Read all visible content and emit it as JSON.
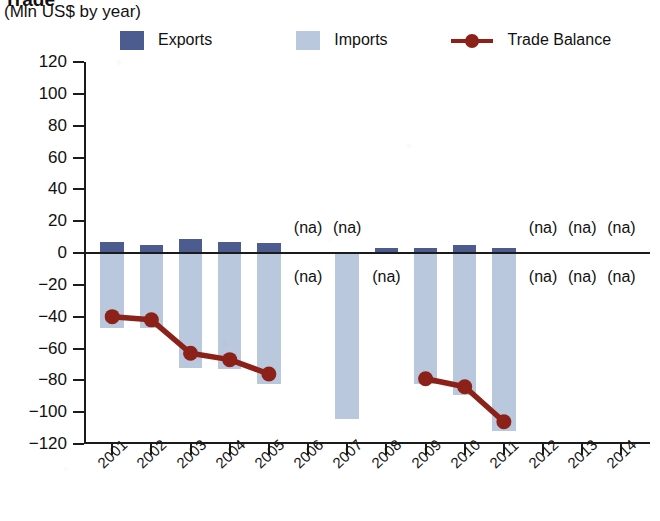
{
  "header": {
    "title": "Trade",
    "subtitle": "(Mln US$ by year)"
  },
  "legend": {
    "items": [
      {
        "label": "Exports",
        "type": "swatch",
        "color": "#4d5c8e"
      },
      {
        "label": "Imports",
        "type": "swatch",
        "color": "#b9c8dc"
      },
      {
        "label": "Trade Balance",
        "type": "line",
        "color": "#8b2118"
      }
    ]
  },
  "colors": {
    "exports": "#4d5c8e",
    "imports": "#b9c8dc",
    "trade_balance": "#8b2118",
    "axis": "#1b1b1b",
    "background": "#ffffff"
  },
  "na_text": "(na)",
  "chart_data": {
    "type": "bar",
    "title": "Trade",
    "subtitle": "(Mln US$ by year)",
    "xlabel": "",
    "ylabel": "Mln US$",
    "ylim": [
      -120,
      120
    ],
    "ytick_values": [
      120,
      100,
      80,
      60,
      40,
      20,
      0,
      -20,
      -40,
      -60,
      -80,
      -100,
      -120
    ],
    "ytick_labels": [
      "120",
      "100",
      "80",
      "60",
      "40",
      "20",
      "0",
      "−20",
      "−40",
      "−60",
      "−80",
      "−100",
      "−120"
    ],
    "grid": false,
    "legend_position": "top",
    "categories": [
      "2001",
      "2002",
      "2003",
      "2004",
      "2005",
      "2006",
      "2007",
      "2008",
      "2009",
      "2010",
      "2011",
      "2012",
      "2013",
      "2014"
    ],
    "series": [
      {
        "name": "Exports",
        "kind": "bar",
        "color": "#4d5c8e",
        "values": [
          7,
          5,
          9,
          7,
          6,
          null,
          null,
          3,
          3,
          5,
          3,
          null,
          null,
          null
        ]
      },
      {
        "name": "Imports",
        "kind": "bar",
        "color": "#b9c8dc",
        "values": [
          -47,
          -47,
          -72,
          -73,
          -82,
          null,
          -104,
          null,
          -82,
          -89,
          -112,
          null,
          null,
          null
        ]
      },
      {
        "name": "Trade Balance",
        "kind": "line",
        "color": "#8b2118",
        "values": [
          -40,
          -42,
          -63,
          -67,
          -76,
          null,
          null,
          null,
          -79,
          -84,
          -106,
          null,
          null,
          null
        ]
      }
    ],
    "na_annotations": {
      "above_zero": [
        "2006",
        "2007",
        "2012",
        "2013",
        "2014"
      ],
      "below_zero": [
        "2006",
        "2008",
        "2012",
        "2013",
        "2014"
      ]
    }
  }
}
